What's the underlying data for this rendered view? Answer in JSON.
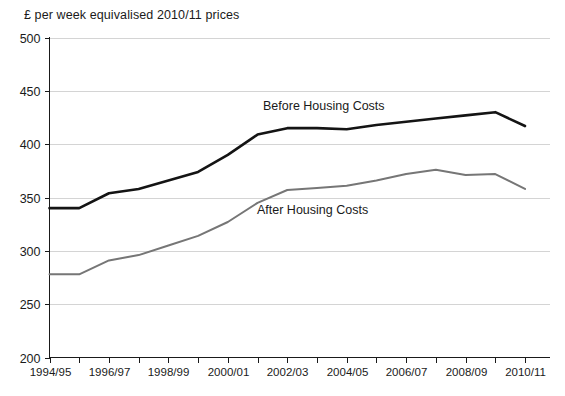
{
  "chart_data": {
    "type": "line",
    "title": "£ per week equivalised 2010/11 prices",
    "xlabel": "",
    "ylabel": "",
    "ylim": [
      200,
      500
    ],
    "ytick_step": 50,
    "yticks": [
      "200",
      "250",
      "300",
      "350",
      "400",
      "450",
      "500"
    ],
    "grid": true,
    "legend_position": "inline-annotation",
    "categories": [
      "1994/95",
      "1995/96",
      "1996/97",
      "1997/98",
      "1998/99",
      "1999/00",
      "2000/01",
      "2001/02",
      "2002/03",
      "2003/04",
      "2004/05",
      "2005/06",
      "2006/07",
      "2007/08",
      "2008/09",
      "2009/10",
      "2010/11"
    ],
    "xtick_labels_shown": [
      "1994/95",
      "1996/97",
      "1998/99",
      "2000/01",
      "2002/03",
      "2004/05",
      "2006/07",
      "2008/09",
      "2010/11"
    ],
    "series": [
      {
        "name": "Before Housing Costs",
        "color": "#141414",
        "values": [
          340,
          340,
          354,
          358,
          366,
          374,
          390,
          409,
          415,
          415,
          414,
          418,
          421,
          424,
          427,
          430,
          417
        ]
      },
      {
        "name": "After Housing Costs",
        "color": "#767676",
        "values": [
          278,
          278,
          291,
          296,
          305,
          314,
          327,
          345,
          357,
          359,
          361,
          366,
          372,
          376,
          371,
          372,
          358
        ]
      }
    ],
    "annotations": [
      {
        "text": "Before Housing Costs",
        "x_px": 263,
        "y_px": 110
      },
      {
        "text": "After Housing Costs",
        "x_px": 257,
        "y_px": 214
      }
    ]
  }
}
